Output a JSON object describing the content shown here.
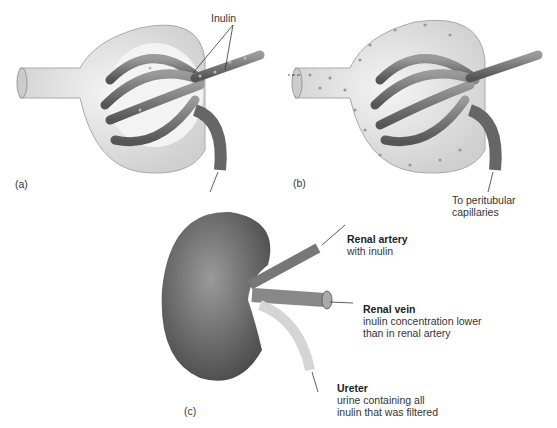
{
  "panels": {
    "a": {
      "label": "(a)",
      "annotation": "Inulin"
    },
    "b": {
      "label": "(b)",
      "annotation": "To peritubular capillaries",
      "annotation_lines": [
        "To peritubular",
        "capillaries"
      ]
    },
    "c": {
      "label": "(c)",
      "renal_artery": {
        "title": "Renal artery",
        "desc": "with inulin"
      },
      "renal_vein": {
        "title": "Renal vein",
        "desc_lines": [
          "inulin concentration lower",
          "than in renal artery"
        ]
      },
      "ureter": {
        "title": "Ureter",
        "desc_lines": [
          "urine containing all",
          "inulin that was filtered"
        ]
      }
    }
  },
  "colors": {
    "vessel": "#7a7a7a",
    "capsule": "#e6e6e6",
    "kidney": "#6e6e6e",
    "ureter": "#d8d8d8"
  }
}
